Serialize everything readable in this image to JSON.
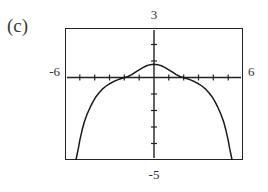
{
  "figure": {
    "part_label": "(c)"
  },
  "axis_labels": {
    "top": "3",
    "bottom": "-5",
    "left": "-6",
    "right": "6"
  },
  "chart_data": {
    "type": "line",
    "title": "(c)",
    "xlabel": "",
    "ylabel": "",
    "xlim": [
      -6,
      6
    ],
    "ylim": [
      -5,
      3
    ],
    "grid": false,
    "legend": null,
    "tick_labels": {
      "x": [
        "-6",
        "6"
      ],
      "y": [
        "-5",
        "3"
      ]
    },
    "x_tick_spacing": 1,
    "y_tick_spacing": 1,
    "series": [
      {
        "name": "curve",
        "x": [
          -5.25,
          -5.1,
          -5.0,
          -4.85,
          -4.7,
          -4.5,
          -4.3,
          -4.1,
          -3.9,
          -3.7,
          -3.5,
          -3.25,
          -3.0,
          -2.75,
          -2.5,
          -2.25,
          -2.0,
          -1.75,
          -1.5,
          -1.25,
          -1.0,
          -0.75,
          -0.5,
          -0.25,
          0,
          0.25,
          0.5,
          0.75,
          1.0,
          1.25,
          1.5,
          1.75,
          2.0,
          2.25,
          2.5,
          2.75,
          3.0,
          3.25,
          3.5,
          3.7,
          3.9,
          4.1,
          4.3,
          4.5,
          4.7,
          4.85,
          5.0,
          5.1,
          5.25
        ],
        "y": [
          -5.0,
          -4.3,
          -3.8,
          -3.2,
          -2.7,
          -2.2,
          -1.8,
          -1.45,
          -1.15,
          -0.92,
          -0.72,
          -0.53,
          -0.38,
          -0.26,
          -0.16,
          -0.08,
          -0.02,
          0.06,
          0.17,
          0.32,
          0.46,
          0.6,
          0.71,
          0.78,
          0.8,
          0.78,
          0.71,
          0.6,
          0.46,
          0.32,
          0.17,
          0.06,
          -0.02,
          -0.08,
          -0.16,
          -0.26,
          -0.38,
          -0.53,
          -0.72,
          -0.92,
          -1.15,
          -1.45,
          -1.8,
          -2.2,
          -2.7,
          -3.2,
          -3.8,
          -4.3,
          -5.0
        ]
      }
    ]
  }
}
